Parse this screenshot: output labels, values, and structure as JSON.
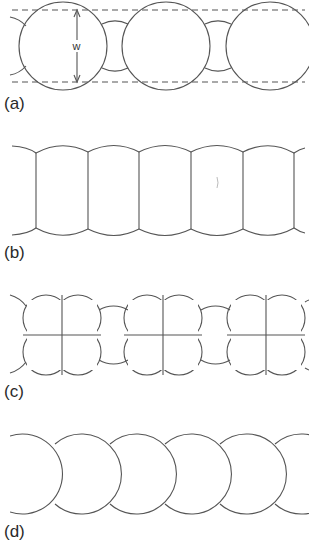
{
  "figure": {
    "panels": [
      {
        "id": "a",
        "label": "(a)",
        "description": "Spheres of width w alternating with smaller spheres between dashed boundary lines",
        "dimension_label": "w"
      },
      {
        "id": "b",
        "label": "(b)",
        "description": "Compressed cells forming a barrel-shaped chain"
      },
      {
        "id": "c",
        "label": "(c)",
        "description": "Groups of four cells (quadrants) alternating with small spheres"
      },
      {
        "id": "d",
        "label": "(d)",
        "description": "Chain of overlapping circles"
      }
    ]
  }
}
